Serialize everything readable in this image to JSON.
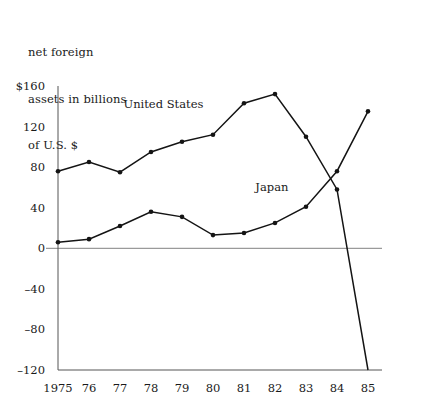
{
  "caption": {
    "line1": "net foreign",
    "line2": "assets in billions",
    "line3": "of U.S. $"
  },
  "chart_data": {
    "type": "line",
    "title": "net foreign assets in billions of U.S. $",
    "xlabel": "",
    "ylabel": "net foreign assets in billions of U.S. $",
    "categories": [
      "1975",
      "76",
      "77",
      "78",
      "79",
      "80",
      "81",
      "82",
      "83",
      "84",
      "85"
    ],
    "x": [
      1975,
      1976,
      1977,
      1978,
      1979,
      1980,
      1981,
      1982,
      1983,
      1984,
      1985
    ],
    "series": [
      {
        "name": "United States",
        "values": [
          76,
          85,
          75,
          95,
          105,
          112,
          143,
          152,
          110,
          58,
          -120
        ]
      },
      {
        "name": "Japan",
        "values": [
          6,
          9,
          22,
          36,
          31,
          13,
          15,
          25,
          41,
          76,
          135
        ]
      }
    ],
    "ylim": [
      -120,
      160
    ],
    "yticks": [
      160,
      120,
      80,
      40,
      0,
      -40,
      -80,
      -120
    ],
    "ytick_labels": [
      "$160",
      "120",
      "80",
      "40",
      "0",
      "–40",
      "–80",
      "–120"
    ],
    "grid": false,
    "zero_line": true,
    "legend": "inline-annotations",
    "annotations": [
      {
        "text": "United States",
        "x": 1978.4,
        "y": 138
      },
      {
        "text": "Japan",
        "x": 1981.9,
        "y": 56
      }
    ],
    "colors": {
      "line": "#141414",
      "axis": "#555555",
      "zero_line": "#9a9a9a",
      "background": "#ffffff"
    }
  }
}
